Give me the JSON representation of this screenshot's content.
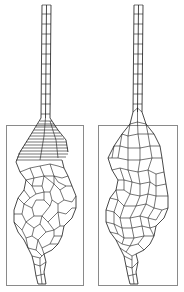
{
  "figure": {
    "panels": [
      {
        "id": "left",
        "description": "Finite element mesh with refined layered band at top of bulb",
        "frame": {
          "x": 6,
          "y": 125,
          "w": 77,
          "h": 160
        },
        "stem": {
          "x1": 42,
          "x2": 51,
          "top": 5,
          "bottom": 120,
          "rows": 12
        }
      },
      {
        "id": "right",
        "description": "Finite element mesh, uniform coarse quadrilaterals",
        "frame": {
          "x": 98,
          "y": 125,
          "w": 79,
          "h": 160
        },
        "stem": {
          "x1": 134,
          "x2": 143,
          "top": 5,
          "bottom": 120,
          "rows": 12
        }
      }
    ],
    "colors": {
      "line": "#1a1a1a",
      "frame": "#8a8a8a",
      "background": "#ffffff"
    }
  }
}
